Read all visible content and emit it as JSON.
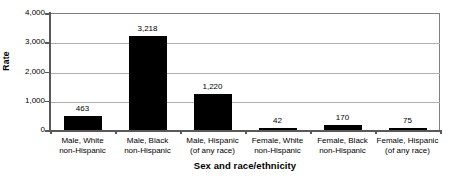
{
  "chart_data": {
    "type": "bar",
    "title": "",
    "xlabel": "Sex and race/ethnicity",
    "ylabel": "Rate",
    "categories": [
      "Male, White\nnon-Hispanic",
      "Male, Black\nnon-Hispanic",
      "Male, Hispanic\n(of any race)",
      "Female, White\nnon-Hispanic",
      "Female, Black\nnon-Hispanic",
      "Female, Hispanic\n(of any race)"
    ],
    "values": [
      463,
      3218,
      1220,
      42,
      170,
      75
    ],
    "data_labels": [
      "463",
      "3,218",
      "1,220",
      "42",
      "170",
      "75"
    ],
    "ylim": [
      0,
      4000
    ],
    "ytick_values": [
      0,
      1000,
      2000,
      3000,
      4000
    ],
    "ytick_labels": [
      "0",
      "1,000",
      "2,000",
      "3,000",
      "4,000"
    ],
    "grid": true,
    "legend": false,
    "bar_color": "#000000",
    "gridline_color": "#b0b0b0",
    "axis_color": "#595959"
  },
  "categories_lines": [
    [
      "Male, White",
      "non-Hispanic"
    ],
    [
      "Male, Black",
      "non-Hispanic"
    ],
    [
      "Male, Hispanic",
      "(of any race)"
    ],
    [
      "Female, White",
      "non-Hispanic"
    ],
    [
      "Female, Black",
      "non-Hispanic"
    ],
    [
      "Female, Hispanic",
      "(of any race)"
    ]
  ],
  "axes": {
    "y_title": "Rate",
    "x_title": "Sex and race/ethnicity"
  },
  "title_text": ""
}
